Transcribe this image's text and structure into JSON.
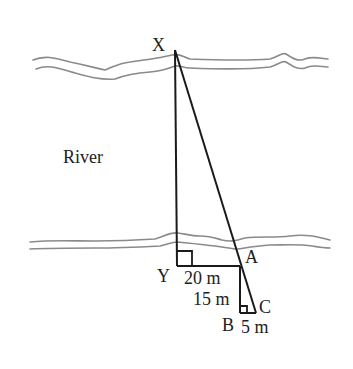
{
  "diagram": {
    "region_label": "River",
    "points": {
      "X": {
        "label": "X",
        "x": 175,
        "y": 50
      },
      "Y": {
        "label": "Y",
        "x": 177,
        "y": 266
      },
      "A": {
        "label": "A",
        "x": 240,
        "y": 266
      },
      "B": {
        "label": "B",
        "x": 240,
        "y": 313
      },
      "C": {
        "label": "C",
        "x": 256,
        "y": 313
      }
    },
    "measurements": {
      "YA": "20 m",
      "AB": "15 m",
      "BC": "5 m"
    },
    "colors": {
      "lines": "#1a1a1a",
      "banks": "#8a8a8a",
      "text": "#222222",
      "background": "#ffffff"
    }
  }
}
